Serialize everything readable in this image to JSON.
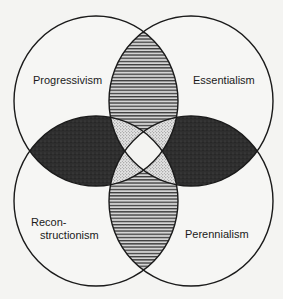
{
  "diagram": {
    "type": "venn-4-circle",
    "circles": [
      {
        "id": "top-left",
        "label": "Progressivism"
      },
      {
        "id": "top-right",
        "label": "Essentialism"
      },
      {
        "id": "bottom-left",
        "label_line1": "Recon-",
        "label_line2": "structionism"
      },
      {
        "id": "bottom-right",
        "label": "Perennialism"
      }
    ],
    "fills": {
      "background": "#f4f4f2",
      "circle_fill": "#f6f6f4",
      "stroke": "#1a1a1a",
      "horizontal_hatch_lens": "#8a8a8a",
      "dark_lens": "#2b2b2b",
      "dotted_region": "#cfcfcf",
      "center": "#f2f2f2"
    },
    "regions": {
      "top_lens": "horizontal-hatch (Progressivism ∩ Essentialism)",
      "bottom_lens": "horizontal-hatch (Reconstructionism ∩ Perennialism)",
      "left_lens": "dark (Progressivism ∩ Reconstructionism)",
      "right_lens": "dark (Essentialism ∩ Perennialism)",
      "triple_overlaps": "stippled",
      "center": "white (all four)"
    }
  }
}
